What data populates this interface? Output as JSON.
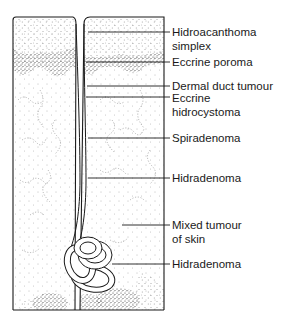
{
  "diagram": {
    "labels": [
      {
        "id": "hidroacanthoma-simplex",
        "lines": [
          "Hidroacanthoma",
          "simplex"
        ],
        "leader_y": 32,
        "text_y": 26
      },
      {
        "id": "eccrine-poroma",
        "lines": [
          "Eccrine poroma"
        ],
        "leader_y": 62,
        "text_y": 56
      },
      {
        "id": "dermal-duct-tumour",
        "lines": [
          "Dermal duct tumour"
        ],
        "leader_y": 86,
        "text_y": 80
      },
      {
        "id": "eccrine-hidrocystoma",
        "lines": [
          "Eccrine",
          "hidrocystoma"
        ],
        "leader_y": 97,
        "text_y": 92
      },
      {
        "id": "spiradenoma",
        "lines": [
          "Spiradenoma"
        ],
        "leader_y": 138,
        "text_y": 132
      },
      {
        "id": "hidradenoma-upper",
        "lines": [
          "Hidradenoma"
        ],
        "leader_y": 178,
        "text_y": 172
      },
      {
        "id": "mixed-tumour-of-skin",
        "lines": [
          "Mixed tumour",
          "of skin"
        ],
        "leader_y": 225,
        "text_y": 219
      },
      {
        "id": "hidradenoma-lower",
        "lines": [
          "Hidradenoma"
        ],
        "leader_y": 264,
        "text_y": 258
      }
    ],
    "colors": {
      "ink": "#1a1a1a",
      "stipple": "#555555",
      "background": "#ffffff"
    }
  }
}
